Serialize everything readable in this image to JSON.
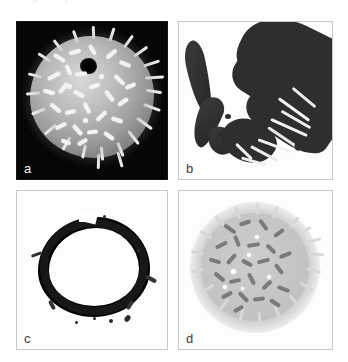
{
  "page": {
    "background_color": "#ffffff",
    "width": 348,
    "height": 362,
    "caption_fragment": "Fig.  ciliate  protist  with  attached  bacteria"
  },
  "figure": {
    "name": "micrograph-panel-grid",
    "layout": "2x2",
    "panels": [
      {
        "id": "a",
        "label": "a",
        "position": "top-left",
        "background": "black",
        "label_color": "#f2f2f2",
        "border_color": "#141414",
        "modality": "scanning-electron-micrograph",
        "description": "Spherical cell on black field with dark central pore and numerous bright rod-shaped bacteria plus radiating cilia on its surface"
      },
      {
        "id": "b",
        "label": "b",
        "position": "top-right",
        "background": "white",
        "label_color": "#3b3b3b",
        "border_color": "#c8c8c8",
        "modality": "light-micrograph",
        "description": "Dark elongated tubular structure with a curved projecting arm and a granular fringe of attached filaments"
      },
      {
        "id": "c",
        "label": "c",
        "position": "bottom-left",
        "background": "white",
        "label_color": "#3b3b3b",
        "border_color": "#c8c8c8",
        "modality": "thresholded-binary-image",
        "description": "High-contrast dark ring outline with hollow white centre and small spurs around the rim"
      },
      {
        "id": "d",
        "label": "d",
        "position": "bottom-right",
        "background": "white",
        "label_color": "#3b3b3b",
        "border_color": "#c8c8c8",
        "modality": "inverted-contrast-micrograph",
        "description": "Light grey disc with bright white halo, dark curved rod-shaped bacteria and small bright spots across the surface"
      }
    ]
  }
}
